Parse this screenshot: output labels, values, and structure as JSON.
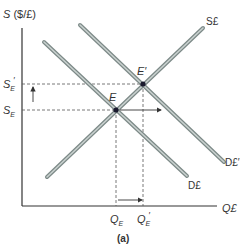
{
  "diagram": {
    "y_axis_label": "S ($/£)",
    "x_axis_label": "Q£",
    "caption": "(a)",
    "curves": {
      "supply": {
        "label": "S£"
      },
      "demand": {
        "label": "D£"
      },
      "demand_shifted": {
        "label": "D£′"
      }
    },
    "points": {
      "equilibrium": {
        "label": "E"
      },
      "new_equilibrium": {
        "label": "E′"
      }
    },
    "y_ticks": {
      "rate": {
        "label_main": "S",
        "label_sub": "E"
      },
      "new_rate": {
        "label_main": "S",
        "label_sub": "E",
        "label_prime": "′"
      }
    },
    "x_ticks": {
      "quantity": {
        "label_main": "Q",
        "label_sub": "E"
      },
      "new_quantity": {
        "label_main": "Q",
        "label_sub": "E",
        "label_prime": "′"
      }
    },
    "colors": {
      "curve_outer": "#7d8a88",
      "curve_inner": "#c9d1cf",
      "axis": "#333333",
      "guide": "#555555",
      "point": "#1a1a2e"
    }
  }
}
